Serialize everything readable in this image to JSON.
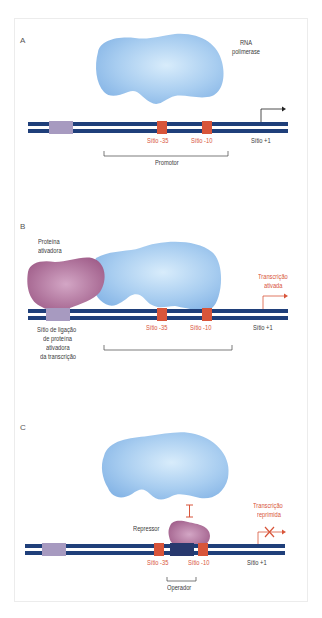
{
  "colors": {
    "dna_strand": "#1f3f7a",
    "site_marker": "#d8553a",
    "binding_site": "#a79ac0",
    "polymerase": "#9cc4ec",
    "activator": "#b06d96",
    "label_red": "#d8553a",
    "label_dark": "#3a3a3a"
  },
  "panels": [
    {
      "letter": "A",
      "polymerase_label_1": "RNA",
      "polymerase_label_2": "polimerase",
      "site_35": "Sítio -35",
      "site_10": "Sítio -10",
      "site_plus1": "Sítio +1",
      "bracket_label": "Promotor"
    },
    {
      "letter": "B",
      "activator_label_1": "Proteína",
      "activator_label_2": "ativadora",
      "site_35": "Sítio -35",
      "site_10": "Sítio -10",
      "site_plus1": "Sítio +1",
      "transcription_label_1": "Transcrição",
      "transcription_label_2": "ativada",
      "binding_label_1": "Sítio de ligação",
      "binding_label_2": "de proteína",
      "binding_label_3": "ativadora",
      "binding_label_4": "da transcrição"
    },
    {
      "letter": "C",
      "repressor_label": "Repressor",
      "site_35": "Sítio -35",
      "site_10": "Sítio -10",
      "site_plus1": "Sítio +1",
      "transcription_label_1": "Transcrição",
      "transcription_label_2": "reprimida",
      "bracket_label": "Operador"
    }
  ]
}
